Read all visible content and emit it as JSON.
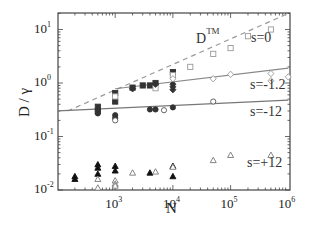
{
  "chart_data": {
    "type": "scatter",
    "title": "",
    "xlabel": "N",
    "ylabel": "D / γ",
    "xscale": "log",
    "yscale": "log",
    "xlim": [
      100,
      1000000
    ],
    "ylim": [
      0.01,
      20
    ],
    "x_ticks": [
      {
        "base": "10",
        "exp": "3",
        "value": 1000
      },
      {
        "base": "10",
        "exp": "4",
        "value": 10000
      },
      {
        "base": "10",
        "exp": "5",
        "value": 100000
      },
      {
        "base": "10",
        "exp": "6",
        "value": 1000000
      }
    ],
    "y_ticks": [
      {
        "base": "10",
        "exp": "1",
        "value": 10
      },
      {
        "base": "10",
        "exp": "0",
        "value": 1
      },
      {
        "base": "10",
        "exp": "-1",
        "value": 0.1
      },
      {
        "base": "10",
        "exp": "-2",
        "value": 0.01
      }
    ],
    "grid": false,
    "annotations": [
      {
        "text": "D",
        "sup": "TM",
        "id": "dtm"
      },
      {
        "text": "s=0"
      },
      {
        "text": "s=-1.2"
      },
      {
        "text": "s=-12"
      },
      {
        "text": "s=+12"
      }
    ],
    "lines": [
      {
        "name": "D^TM",
        "style": "dashed",
        "color": "#999999",
        "points": [
          [
            150,
            0.3
          ],
          [
            1000000,
            20
          ]
        ]
      },
      {
        "name": "fit s=-1.2",
        "style": "solid",
        "color": "#888888",
        "points": [
          [
            1000,
            0.78
          ],
          [
            1000000,
            1.9
          ]
        ]
      },
      {
        "name": "fit s=-12",
        "style": "solid",
        "color": "#777777",
        "points": [
          [
            100,
            0.3
          ],
          [
            1000000,
            0.48
          ]
        ]
      }
    ],
    "series": [
      {
        "name": "s=0 (filled squares)",
        "marker": "square",
        "filled": true,
        "color": "#333333",
        "points": [
          [
            500,
            0.36
          ],
          [
            500,
            0.3
          ],
          [
            1000,
            0.65
          ],
          [
            1000,
            0.45
          ],
          [
            2000,
            0.82
          ],
          [
            3000,
            0.9
          ],
          [
            4000,
            0.9
          ],
          [
            5000,
            1.0
          ],
          [
            10000,
            1.6
          ]
        ]
      },
      {
        "name": "s=0 (open squares)",
        "marker": "square",
        "filled": false,
        "color": "#999999",
        "points": [
          [
            1000,
            0.56
          ],
          [
            5000,
            0.8
          ],
          [
            10000,
            1.4
          ],
          [
            20000,
            2.0
          ],
          [
            50000,
            3.5
          ],
          [
            100000,
            4.5
          ],
          [
            200000,
            7.5
          ],
          [
            500000,
            10.0
          ]
        ]
      },
      {
        "name": "s=-1.2 (filled diamonds)",
        "marker": "diamond",
        "filled": true,
        "color": "#333333",
        "points": [
          [
            2000,
            0.78
          ],
          [
            5000,
            0.95
          ],
          [
            10000,
            0.95
          ],
          [
            10000,
            0.85
          ],
          [
            10000,
            0.75
          ]
        ]
      },
      {
        "name": "s=-1.2 (open diamonds)",
        "marker": "diamond",
        "filled": false,
        "color": "#999999",
        "points": [
          [
            10000,
            1.2
          ],
          [
            50000,
            1.2
          ],
          [
            100000,
            1.45
          ],
          [
            500000,
            1.5
          ],
          [
            500000,
            1.1
          ],
          [
            1000000,
            1.3
          ]
        ]
      },
      {
        "name": "s=-12 (filled circles)",
        "marker": "circle",
        "filled": true,
        "color": "#333333",
        "points": [
          [
            500,
            0.3
          ],
          [
            500,
            0.27
          ],
          [
            1000,
            0.25
          ],
          [
            1000,
            0.22
          ],
          [
            4000,
            0.32
          ],
          [
            5000,
            0.32
          ],
          [
            10000,
            0.35
          ]
        ]
      },
      {
        "name": "s=-12 (open circles)",
        "marker": "circle",
        "filled": false,
        "color": "#555555",
        "points": [
          [
            1000,
            0.2
          ],
          [
            7000,
            0.31
          ],
          [
            50000,
            0.45
          ]
        ]
      },
      {
        "name": "s=+12 (filled triangles)",
        "marker": "triangle",
        "filled": true,
        "color": "#111111",
        "points": [
          [
            200,
            0.018
          ],
          [
            200,
            0.016
          ],
          [
            500,
            0.03
          ],
          [
            500,
            0.026
          ],
          [
            500,
            0.02
          ],
          [
            1000,
            0.028
          ],
          [
            1000,
            0.023
          ],
          [
            4000,
            0.021
          ],
          [
            10000,
            0.028
          ],
          [
            10000,
            0.018
          ]
        ]
      },
      {
        "name": "s=+12 (open triangles)",
        "marker": "triangle",
        "filled": false,
        "color": "#777777",
        "points": [
          [
            500,
            0.016
          ],
          [
            500,
            0.011
          ],
          [
            1000,
            0.015
          ],
          [
            1000,
            0.013
          ],
          [
            1000,
            0.012
          ],
          [
            2000,
            0.021
          ],
          [
            5000,
            0.022
          ],
          [
            10000,
            0.027
          ],
          [
            50000,
            0.036
          ],
          [
            100000,
            0.045
          ],
          [
            500000,
            0.045
          ]
        ]
      }
    ]
  }
}
